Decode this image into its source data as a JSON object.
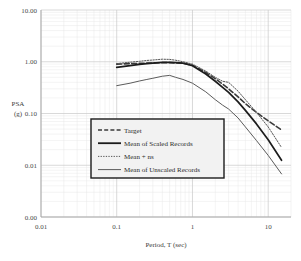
{
  "chart_data": {
    "type": "line",
    "title": "",
    "xlabel": "Period, T (sec)",
    "ylabel": "PSA\n(g)",
    "ylabel_line1": "PSA",
    "ylabel_line2": "(g)",
    "xscale": "log",
    "yscale": "log",
    "xlim": [
      0.01,
      20
    ],
    "ylim": [
      0.001,
      10
    ],
    "grid": true,
    "legend_position": "center",
    "xticks": [
      "0.01",
      "0.1",
      "1",
      "10"
    ],
    "xtick_values": [
      0.01,
      0.1,
      1,
      10
    ],
    "yticks": [
      "10.00",
      "1.00",
      "0.10",
      "0.01",
      "0.00"
    ],
    "ytick_values": [
      10,
      1,
      0.1,
      0.01,
      0.001
    ],
    "x": [
      0.1,
      0.15,
      0.2,
      0.25,
      0.3,
      0.4,
      0.5,
      0.6,
      0.75,
      1.0,
      1.5,
      2.0,
      2.5,
      3.0,
      4.0,
      5.0,
      7.0,
      10.0,
      15.0
    ],
    "series": [
      {
        "name": "Target",
        "style": "dashed",
        "color": "#3a3a3a",
        "width": 1.6,
        "values": [
          0.9,
          0.92,
          0.93,
          0.94,
          0.95,
          0.96,
          0.96,
          0.95,
          0.94,
          0.86,
          0.62,
          0.47,
          0.37,
          0.3,
          0.21,
          0.155,
          0.105,
          0.072,
          0.048
        ]
      },
      {
        "name": "Mean of Scaled Records",
        "style": "solid",
        "color": "#1c1c1c",
        "width": 1.7,
        "values": [
          0.78,
          0.84,
          0.89,
          0.92,
          0.94,
          0.97,
          0.97,
          0.96,
          0.94,
          0.84,
          0.58,
          0.42,
          0.32,
          0.255,
          0.168,
          0.115,
          0.063,
          0.031,
          0.0125
        ]
      },
      {
        "name": "Mean + ns",
        "style": "dotted",
        "color": "#555555",
        "width": 1.0,
        "values": [
          0.92,
          0.98,
          1.02,
          1.06,
          1.08,
          1.12,
          1.11,
          1.07,
          1.0,
          0.9,
          0.66,
          0.5,
          0.42,
          0.4,
          0.27,
          0.185,
          0.105,
          0.055,
          0.022
        ]
      },
      {
        "name": "Mean of Unscaled Records",
        "style": "solid",
        "color": "#5b5b5b",
        "width": 1.0,
        "values": [
          0.345,
          0.385,
          0.425,
          0.455,
          0.48,
          0.525,
          0.545,
          0.5,
          0.455,
          0.385,
          0.262,
          0.185,
          0.145,
          0.122,
          0.082,
          0.055,
          0.03,
          0.0155,
          0.0068
        ]
      }
    ]
  },
  "legend": {
    "items": [
      {
        "label": "Target",
        "style": "dashed"
      },
      {
        "label": "Mean of Scaled Records",
        "style": "solid-thick"
      },
      {
        "label": "Mean + ns",
        "style": "dotted"
      },
      {
        "label": "Mean of Unscaled Records",
        "style": "solid-thin"
      }
    ]
  },
  "colors": {
    "axis": "#a8a8a8",
    "grid_major": "#c9c9c9",
    "grid_minor": "#e6e6e6",
    "text": "#3a3a3a",
    "legend_border": "#1c1c1c",
    "legend_fill": "#f2f2f2"
  }
}
